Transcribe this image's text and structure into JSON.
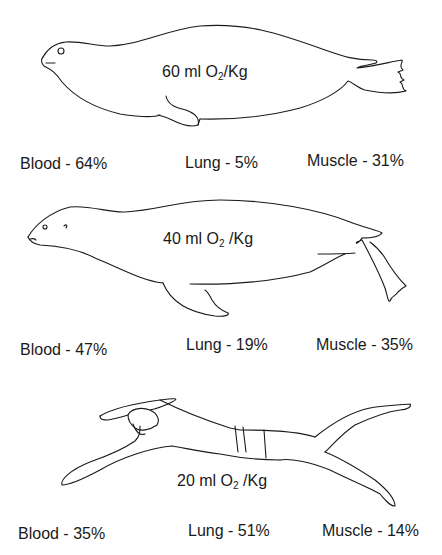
{
  "panels": [
    {
      "subject": "seal",
      "oxygen_store": {
        "value": "60 ml O",
        "sub": "2",
        "unit": "/Kg"
      },
      "blood": "Blood -  64%",
      "lung": "Lung - 5%",
      "muscle": "Muscle - 31%"
    },
    {
      "subject": "sea lion",
      "oxygen_store": {
        "value": "40 ml O",
        "sub": "2",
        "unit": " /Kg"
      },
      "blood": "Blood - 47%",
      "lung": "Lung -  19%",
      "muscle": "Muscle - 35%"
    },
    {
      "subject": "human swimmer",
      "oxygen_store": {
        "value": "20 ml O",
        "sub": "2",
        "unit": " /Kg"
      },
      "blood": "Blood - 35%",
      "lung": "Lung - 51%",
      "muscle": "Muscle - 14%"
    }
  ]
}
